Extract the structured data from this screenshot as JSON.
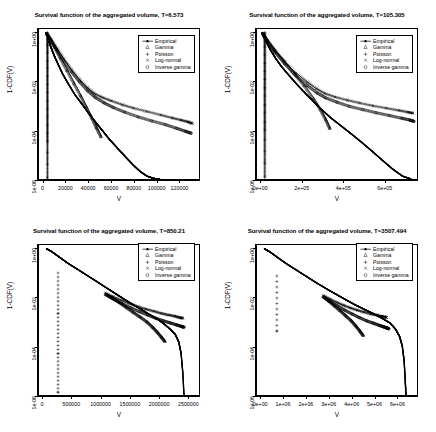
{
  "figure": {
    "axis_labels": {
      "x": "V",
      "y": "1-CDF(V)"
    },
    "legend_entries": [
      {
        "label": "Empirical",
        "symbol": "line-dot"
      },
      {
        "label": "Gamma",
        "symbol": "triangle"
      },
      {
        "label": "Poisson",
        "symbol": "plus"
      },
      {
        "label": "Log-normal",
        "symbol": "cross"
      },
      {
        "label": "Inverse gamma",
        "symbol": "circle"
      }
    ],
    "y_tick_labels": [
      "1e+00",
      "1e-02",
      "1e-04",
      "1e-06"
    ]
  },
  "chart_data": [
    {
      "type": "line",
      "title": "Survival function of the aggregated volume, T=6.573",
      "xlabel": "V",
      "ylabel": "1-CDF(V)",
      "yscale": "log",
      "ylim": [
        1e-06,
        1.4
      ],
      "ytick_values": [
        1,
        0.01,
        0.0001,
        1e-06
      ],
      "ytick_labels": [
        "1e+00",
        "1e-02",
        "1e-04",
        "1e-06"
      ],
      "xlim": [
        -4000,
        138000
      ],
      "xtick_values": [
        0,
        20000,
        40000,
        60000,
        80000,
        100000,
        120000
      ],
      "xtick_labels": [
        "0",
        "20000",
        "40000",
        "60000",
        "80000",
        "100000",
        "120000"
      ],
      "grid": false,
      "legend_position": "top-right",
      "series": [
        {
          "name": "Empirical",
          "symbol": "line-dot",
          "x": [
            2000,
            3000,
            4000,
            5000,
            6000,
            8000,
            10000,
            13000,
            17000,
            22000,
            28000,
            34000,
            40000,
            46000,
            52000,
            58000,
            62000,
            68000,
            74000,
            80000,
            86000,
            92000,
            98000,
            103000
          ],
          "y": [
            0.95,
            0.8,
            0.6,
            0.42,
            0.3,
            0.17,
            0.1,
            0.05,
            0.02,
            0.008,
            0.0028,
            0.0012,
            0.0005,
            0.00022,
            0.0001,
            4.5e-05,
            2.8e-05,
            1.4e-05,
            7e-06,
            3.6e-06,
            2e-06,
            1.3e-06,
            1.05e-06,
            1e-06
          ]
        },
        {
          "name": "Gamma",
          "symbol": "triangle",
          "x": [
            3000,
            6000,
            10000,
            15000,
            21000,
            27000,
            33000,
            38000,
            43000,
            47000,
            51000
          ],
          "y": [
            0.9,
            0.55,
            0.25,
            0.09,
            0.028,
            0.0085,
            0.0026,
            0.0009,
            0.00032,
            0.00013,
            5.5e-05
          ]
        },
        {
          "name": "Poisson",
          "symbol": "plus",
          "x": [
            3500,
            3500,
            3500,
            3500,
            3500,
            3500,
            3500,
            3500,
            3500,
            3500,
            3500,
            3500,
            3500,
            3500,
            3500,
            3500,
            3500,
            3500
          ],
          "y": [
            1.0,
            0.55,
            0.3,
            0.15,
            0.07,
            0.035,
            0.016,
            0.0075,
            0.0035,
            0.0016,
            0.00075,
            0.00035,
            0.00016,
            7.5e-05,
            3.5e-05,
            1.2e-05,
            4e-06,
            1.1e-06
          ]
        },
        {
          "name": "Log-normal",
          "symbol": "cross",
          "x": [
            3000,
            7000,
            12000,
            18000,
            25000,
            32000,
            39000,
            45000,
            52000,
            60000,
            70000,
            80000,
            92000,
            104000,
            114000,
            122000,
            128000,
            132000
          ],
          "y": [
            0.9,
            0.5,
            0.22,
            0.085,
            0.03,
            0.012,
            0.0055,
            0.0032,
            0.0022,
            0.0016,
            0.0011,
            0.0008,
            0.00058,
            0.00042,
            0.00032,
            0.00026,
            0.00022,
            0.00019
          ]
        },
        {
          "name": "Inverse gamma",
          "symbol": "circle",
          "x": [
            3000,
            7000,
            12000,
            18000,
            25000,
            32000,
            39000,
            46000,
            54000,
            62000,
            72000,
            84000,
            96000,
            108000,
            118000,
            126000,
            131000
          ],
          "y": [
            0.88,
            0.46,
            0.19,
            0.07,
            0.024,
            0.0095,
            0.0042,
            0.0022,
            0.0013,
            0.00085,
            0.00055,
            0.00035,
            0.00024,
            0.00017,
            0.00012,
            9e-05,
            7.5e-05
          ]
        }
      ]
    },
    {
      "type": "line",
      "title": "Survival function of the aggregated volume, T=105.305",
      "xlabel": "V",
      "ylabel": "1-CDF(V)",
      "yscale": "log",
      "ylim": [
        1e-06,
        1.4
      ],
      "ytick_values": [
        1,
        0.01,
        0.0001,
        1e-06
      ],
      "ytick_labels": [
        "1e+00",
        "1e-02",
        "1e-04",
        "1e-06"
      ],
      "xlim": [
        -20000,
        760000
      ],
      "xtick_values": [
        0,
        200000,
        400000,
        600000
      ],
      "xtick_labels": [
        "0e+00",
        "2e+05",
        "4e+05",
        "6e+05"
      ],
      "grid": false,
      "legend_position": "top-right",
      "series": [
        {
          "name": "Empirical",
          "symbol": "line-dot",
          "x": [
            5000,
            12000,
            25000,
            45000,
            70000,
            100000,
            135000,
            175000,
            215000,
            255000,
            295000,
            340000,
            390000,
            440000,
            490000,
            540000,
            590000,
            640000,
            690000,
            730000
          ],
          "y": [
            0.98,
            0.7,
            0.42,
            0.2,
            0.09,
            0.04,
            0.018,
            0.0075,
            0.0033,
            0.0015,
            0.0007,
            0.00032,
            0.00015,
            7e-05,
            3.2e-05,
            1.4e-05,
            6e-06,
            2.6e-06,
            1.3e-06,
            1e-06
          ]
        },
        {
          "name": "Gamma",
          "symbol": "triangle",
          "x": [
            8000,
            30000,
            65000,
            110000,
            160000,
            210000,
            255000,
            290000,
            315000,
            335000
          ],
          "y": [
            0.93,
            0.5,
            0.2,
            0.07,
            0.022,
            0.0068,
            0.002,
            0.0007,
            0.00028,
            0.00012
          ]
        },
        {
          "name": "Poisson",
          "symbol": "plus",
          "x": [
            18000,
            18000,
            18000,
            18000,
            18000,
            18000,
            18000,
            18000,
            18000,
            18000,
            18000,
            18000,
            18000,
            18000,
            18000,
            18000,
            18000
          ],
          "y": [
            1.0,
            0.5,
            0.25,
            0.12,
            0.055,
            0.026,
            0.012,
            0.0055,
            0.0025,
            0.0011,
            0.0005,
            0.00022,
            0.0001,
            4e-05,
            1.4e-05,
            4.5e-06,
            1.2e-06
          ]
        },
        {
          "name": "Log-normal",
          "symbol": "cross",
          "x": [
            8000,
            30000,
            68000,
            115000,
            170000,
            225000,
            270000,
            310000,
            360000,
            420000,
            480000,
            545000,
            610000,
            670000,
            715000,
            740000
          ],
          "y": [
            0.92,
            0.46,
            0.18,
            0.065,
            0.022,
            0.0095,
            0.005,
            0.0032,
            0.0023,
            0.0017,
            0.0013,
            0.001,
            0.0008,
            0.00065,
            0.00055,
            0.0005
          ]
        },
        {
          "name": "Inverse gamma",
          "symbol": "circle",
          "x": [
            8000,
            30000,
            68000,
            115000,
            170000,
            225000,
            272000,
            315000,
            370000,
            430000,
            495000,
            560000,
            625000,
            685000,
            725000,
            745000
          ],
          "y": [
            0.9,
            0.42,
            0.155,
            0.052,
            0.017,
            0.0068,
            0.0034,
            0.0021,
            0.0014,
            0.00095,
            0.0007,
            0.00052,
            0.0004,
            0.00031,
            0.00026,
            0.00023
          ]
        }
      ]
    },
    {
      "type": "line",
      "title": "Survival function of the aggregated volume, T=850.21",
      "xlabel": "V",
      "ylabel": "1-CDF(V)",
      "yscale": "log",
      "ylim": [
        1e-06,
        1.4
      ],
      "ytick_values": [
        1,
        0.01,
        0.0001,
        1e-06
      ],
      "ytick_labels": [
        "1e+00",
        "1e-02",
        "1e-04",
        "1e-06"
      ],
      "xlim": [
        -70000,
        2700000
      ],
      "xtick_values": [
        0,
        500000,
        1000000,
        1500000,
        2000000,
        2500000
      ],
      "xtick_labels": [
        "0",
        "500000",
        "1000000",
        "1500000",
        "2000000",
        "2500000"
      ],
      "grid": false,
      "legend_position": "top-right",
      "series": [
        {
          "name": "Empirical",
          "symbol": "line-dot",
          "x": [
            60000,
            150000,
            280000,
            430000,
            600000,
            780000,
            960000,
            1130000,
            1280000,
            1420000,
            1560000,
            1700000,
            1840000,
            1980000,
            2100000,
            2200000,
            2290000,
            2350000,
            2390000,
            2420000,
            2440000
          ],
          "y": [
            0.99,
            0.75,
            0.45,
            0.25,
            0.14,
            0.075,
            0.04,
            0.022,
            0.013,
            0.008,
            0.005,
            0.0032,
            0.002,
            0.0013,
            0.0008,
            0.0005,
            0.0003,
            0.00015,
            5e-05,
            8e-06,
            1e-06
          ]
        },
        {
          "name": "Gamma",
          "symbol": "triangle",
          "x": [
            1080000,
            1200000,
            1320000,
            1440000,
            1560000,
            1680000,
            1800000,
            1900000,
            1980000,
            2050000,
            2110000
          ],
          "y": [
            0.014,
            0.0095,
            0.0063,
            0.004,
            0.0025,
            0.0016,
            0.001,
            0.0006,
            0.00038,
            0.00024,
            0.00016
          ]
        },
        {
          "name": "Poisson",
          "symbol": "plus",
          "x": [
            260000,
            260000,
            260000,
            260000
          ],
          "y": [
            0.1,
            0.0022,
            5e-05,
            1.3e-06
          ]
        },
        {
          "name": "Log-normal",
          "symbol": "cross",
          "x": [
            1080000,
            1220000,
            1360000,
            1500000,
            1640000,
            1780000,
            1920000,
            2050000,
            2170000,
            2280000,
            2360000,
            2420000
          ],
          "y": [
            0.015,
            0.0105,
            0.0075,
            0.0055,
            0.0042,
            0.0033,
            0.0027,
            0.0022,
            0.0019,
            0.0017,
            0.0015,
            0.0014
          ]
        },
        {
          "name": "Inverse gamma",
          "symbol": "circle",
          "x": [
            1080000,
            1220000,
            1370000,
            1520000,
            1670000,
            1810000,
            1950000,
            2080000,
            2200000,
            2310000,
            2390000,
            2440000
          ],
          "y": [
            0.013,
            0.0085,
            0.0055,
            0.0037,
            0.0026,
            0.0019,
            0.0014,
            0.0011,
            0.0009,
            0.00075,
            0.00065,
            0.0006
          ]
        }
      ]
    },
    {
      "type": "line",
      "title": "Survival function of the aggregated volume, T=3507.494",
      "xlabel": "V",
      "ylabel": "1-CDF(V)",
      "yscale": "log",
      "ylim": [
        1e-06,
        1.4
      ],
      "ytick_values": [
        1,
        0.01,
        0.0001,
        1e-06
      ],
      "ytick_labels": [
        "1e+00",
        "1e-02",
        "1e-04",
        "1e-06"
      ],
      "xlim": [
        -180000,
        6900000
      ],
      "xtick_values": [
        0,
        1000000,
        2000000,
        3000000,
        4000000,
        5000000,
        6000000
      ],
      "xtick_labels": [
        "0e+00",
        "1e+06",
        "2e+06",
        "3e+06",
        "4e+06",
        "5e+06",
        "6e+06"
      ],
      "grid": false,
      "legend_position": "top-right",
      "series": [
        {
          "name": "Empirical",
          "symbol": "line-dot",
          "x": [
            150000,
            400000,
            750000,
            1150000,
            1600000,
            2050000,
            2500000,
            2950000,
            3350000,
            3750000,
            4150000,
            4550000,
            4950000,
            5350000,
            5700000,
            5950000,
            6130000,
            6250000,
            6330000,
            6380000,
            6410000
          ],
          "y": [
            0.99,
            0.72,
            0.42,
            0.23,
            0.125,
            0.068,
            0.037,
            0.021,
            0.013,
            0.008,
            0.005,
            0.0033,
            0.0022,
            0.0014,
            0.0009,
            0.0005,
            0.00025,
            0.0001,
            2.5e-05,
            4e-06,
            1e-06
          ]
        },
        {
          "name": "Gamma",
          "symbol": "triangle",
          "x": [
            2750000,
            3000000,
            3250000,
            3500000,
            3750000,
            4000000,
            4200000,
            4380000,
            4520000
          ],
          "y": [
            0.011,
            0.0072,
            0.0046,
            0.0029,
            0.0018,
            0.0011,
            0.00068,
            0.00042,
            0.00028
          ]
        },
        {
          "name": "Poisson",
          "symbol": "plus",
          "x": [
            700000,
            700000
          ],
          "y": [
            0.075,
            0.00042
          ]
        },
        {
          "name": "Log-normal",
          "symbol": "cross",
          "x": [
            2750000,
            3050000,
            3350000,
            3650000,
            3950000,
            4250000,
            4550000,
            4850000,
            5100000,
            5300000,
            5450000,
            5550000
          ],
          "y": [
            0.012,
            0.0085,
            0.0062,
            0.0047,
            0.0037,
            0.003,
            0.0025,
            0.0021,
            0.0019,
            0.0017,
            0.0016,
            0.0015
          ]
        },
        {
          "name": "Inverse gamma",
          "symbol": "circle",
          "x": [
            2750000,
            3050000,
            3380000,
            3700000,
            4020000,
            4340000,
            4660000,
            4960000,
            5220000,
            5420000,
            5560000,
            5650000
          ],
          "y": [
            0.0105,
            0.0068,
            0.0044,
            0.003,
            0.0021,
            0.0015,
            0.0011,
            0.00088,
            0.00072,
            0.00062,
            0.00056,
            0.00052
          ]
        }
      ]
    }
  ]
}
